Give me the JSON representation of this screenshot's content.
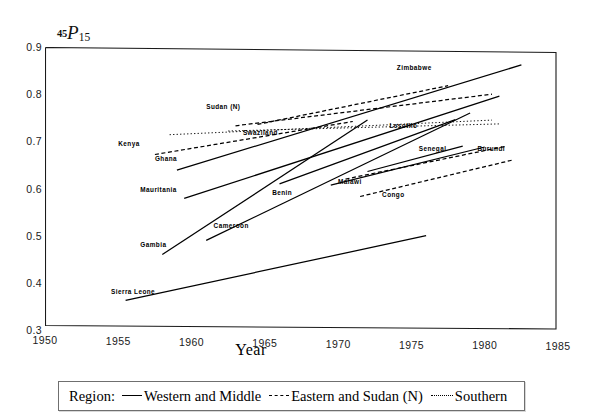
{
  "chart_data": {
    "type": "line",
    "title": "45P15",
    "title_parts": {
      "pre": "45",
      "mid": "P",
      "post": "15"
    },
    "xlabel": "Year",
    "ylabel": "",
    "xlim": [
      1950,
      1985
    ],
    "ylim": [
      0.3,
      0.9
    ],
    "xticks": [
      1950,
      1955,
      1960,
      1965,
      1970,
      1975,
      1980,
      1985
    ],
    "yticks": [
      "0.9",
      "0.8",
      "0.7",
      "0.6",
      "0.5",
      "0.4",
      "0.3"
    ],
    "grid": false,
    "legend_position": "below-plot",
    "series": [
      {
        "name": "Kenya",
        "region": "Eastern and Sudan (N)",
        "style": "dashed",
        "x": [
          1957.5,
          1971.0
        ],
        "values": [
          0.672,
          0.742
        ],
        "label_x": 1955.0,
        "label_y": 0.694
      },
      {
        "name": "Sudan (N)",
        "region": "Eastern and Sudan (N)",
        "style": "dashed",
        "x": [
          1963.0,
          1980.5
        ],
        "values": [
          0.733,
          0.8
        ],
        "label_x": 1961.0,
        "label_y": 0.772
      },
      {
        "name": "Swaziland",
        "region": "Southern",
        "style": "dotted",
        "x": [
          1958.5,
          1980.5
        ],
        "values": [
          0.714,
          0.745
        ],
        "label_x": 1963.5,
        "label_y": 0.718
      },
      {
        "name": "Zimbabwe",
        "region": "Eastern and Sudan (N)",
        "style": "dashed",
        "x": [
          1964.5,
          1977.5
        ],
        "values": [
          0.736,
          0.818
        ],
        "label_x": 1974.0,
        "label_y": 0.855
      },
      {
        "name": "Lesotho",
        "region": "Southern",
        "style": "dotted",
        "x": [
          1962.5,
          1981.0
        ],
        "values": [
          0.722,
          0.737
        ],
        "label_x": 1973.5,
        "label_y": 0.733
      },
      {
        "name": "Ghana",
        "region": "Western and Middle",
        "style": "solid",
        "x": [
          1959.0,
          1982.5
        ],
        "values": [
          0.639,
          0.862
        ],
        "label_x": 1957.5,
        "label_y": 0.663
      },
      {
        "name": "Mauritania",
        "region": "Western and Middle",
        "style": "solid",
        "x": [
          1959.5,
          1981.0
        ],
        "values": [
          0.579,
          0.796
        ],
        "label_x": 1956.5,
        "label_y": 0.596
      },
      {
        "name": "Gambia",
        "region": "Western and Middle",
        "style": "solid",
        "x": [
          1958.0,
          1972.0
        ],
        "values": [
          0.46,
          0.745
        ],
        "label_x": 1956.5,
        "label_y": 0.481
      },
      {
        "name": "Cameroon",
        "region": "Western and Middle",
        "style": "solid",
        "x": [
          1961.0,
          1979.0
        ],
        "values": [
          0.49,
          0.76
        ],
        "label_x": 1961.5,
        "label_y": 0.52
      },
      {
        "name": "Benin",
        "region": "Western and Middle",
        "style": "solid",
        "x": [
          1966.0,
          1978.0
        ],
        "values": [
          0.61,
          0.746
        ],
        "label_x": 1965.5,
        "label_y": 0.59
      },
      {
        "name": "Malawi",
        "region": "Eastern and Sudan (N)",
        "style": "dashed",
        "x": [
          1970.5,
          1981.5
        ],
        "values": [
          0.62,
          0.69
        ],
        "label_x": 1970.0,
        "label_y": 0.613
      },
      {
        "name": "Congo",
        "region": "Western and Middle",
        "style": "solid",
        "x": [
          1969.5,
          1980.0
        ],
        "values": [
          0.607,
          0.688
        ],
        "label_x": 1973.0,
        "label_y": 0.586
      },
      {
        "name": "Senegal",
        "region": "Western and Middle",
        "style": "solid",
        "x": [
          1972.0,
          1978.5
        ],
        "values": [
          0.636,
          0.69
        ],
        "label_x": 1975.5,
        "label_y": 0.684
      },
      {
        "name": "Burundi",
        "region": "Eastern and Sudan (N)",
        "style": "dashed",
        "x": [
          1971.5,
          1982.0
        ],
        "values": [
          0.583,
          0.661
        ],
        "label_x": 1979.5,
        "label_y": 0.684
      },
      {
        "name": "Sierra Leone",
        "region": "Western and Middle",
        "style": "solid",
        "x": [
          1955.5,
          1976.0
        ],
        "values": [
          0.363,
          0.5
        ],
        "label_x": 1954.5,
        "label_y": 0.381
      }
    ]
  },
  "legend": {
    "title": "Region:",
    "entries": [
      {
        "label": "Western and Middle",
        "style": "solid"
      },
      {
        "label": "Eastern and Sudan (N)",
        "style": "dashed"
      },
      {
        "label": "Southern",
        "style": "dotted"
      }
    ]
  },
  "colors": {
    "line": "#000000",
    "frame": "#1a1a1a",
    "background": "#ffffff"
  }
}
